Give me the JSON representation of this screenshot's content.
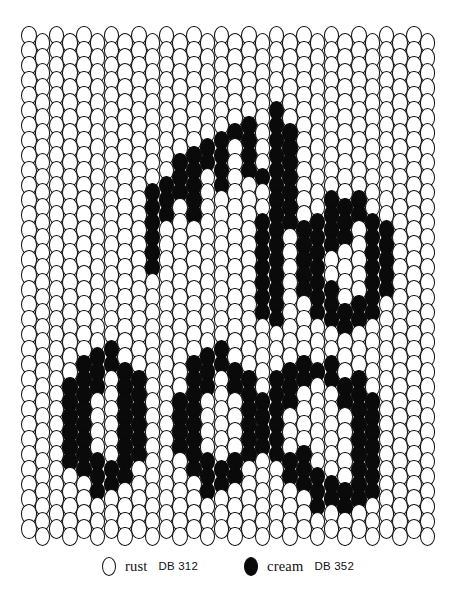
{
  "chart_data": {
    "type": "heatmap",
    "title": "",
    "xlabel": "",
    "ylabel": "",
    "columns": 30,
    "rows": 34,
    "offset_columns": "odd",
    "legend_position": "bottom-center",
    "palette": {
      "0": "#ffffff",
      "1": "#0a0a0a"
    },
    "grid": [
      "000000000000000000000000000000",
      "000000000000000000000000000000",
      "000000000000000000000000000000",
      "000000000000000000000000000000",
      "000000000000000000000000000000",
      "000000000000000000100000000000",
      "000000000000000110110000000000",
      "000000000000011010110000000000",
      "000000000001111010110000000000",
      "000000000001101011110000000000",
      "000000000111101000110000000000",
      "000000000110100000110011100000",
      "000000000110100001110111110000",
      "000000000100000001101111011000",
      "000000000100000001101110011000",
      "000000000100000001101100011000",
      "000000000000000001101100011000",
      "000000000000000001101110011000",
      "000000000000000001100111110000",
      "000000000000000000100011100000",
      "000000000000000000000000000000",
      "000001100000011000000000000000",
      "000011110000111100011110000000",
      "000111011000110110111011100000",
      "000110011001100011110001110000",
      "000110011001100011100000110000",
      "000110011001100011100000110000",
      "000110011001100011100000110000",
      "000111011000110110111000110000",
      "000011110000111100011100110000",
      "000001100000011000001111110000",
      "000000000000000000000111100000",
      "000000000000000000000000000000",
      "000000000000000000000000000000"
    ]
  },
  "legend": {
    "items": [
      {
        "swatch": "open-oval",
        "name": "rust",
        "code": "DB 312",
        "filled": false
      },
      {
        "swatch": "filled-oval",
        "name": "cream",
        "code": "DB 352",
        "filled": true
      }
    ]
  }
}
